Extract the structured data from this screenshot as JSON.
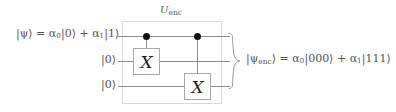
{
  "figure": {
    "type": "quantum-circuit",
    "background_color": "#ffffff",
    "wire_color": "#8d8d8d",
    "box_border_color": "#d9d9d9",
    "gate_border_color": "#a8a8a8",
    "control_dot_color": "#111111",
    "text_color": "#555555"
  },
  "labels": {
    "input_state": "|ψ⟩ = α",
    "input_sub_0": "0",
    "input_ket_0": "|0⟩ + α",
    "input_sub_1": "1",
    "input_ket_1": "|1⟩",
    "unitary_name": "U",
    "unitary_subscript": "enc",
    "output_state_open": "|ψ",
    "output_subscript": "enc",
    "output_state_eq": "⟩ = α",
    "output_sub_0": "0",
    "output_ket_000": "|000⟩ + α",
    "output_sub_1": "1",
    "output_ket_111": "|111⟩"
  },
  "qubits": [
    {
      "index": 0,
      "input_label": "|ψ⟩ = α₀|0⟩ + α₁|1⟩",
      "role": "data"
    },
    {
      "index": 1,
      "input_label": "|0⟩",
      "role": "ancilla"
    },
    {
      "index": 2,
      "input_label": "|0⟩",
      "role": "ancilla"
    }
  ],
  "ancillas": {
    "first": "|0⟩",
    "second": "|0⟩"
  },
  "gates": [
    {
      "name": "CNOT",
      "control_qubit": 0,
      "target_qubit": 1,
      "target_symbol": "X",
      "column": 1
    },
    {
      "name": "CNOT",
      "control_qubit": 0,
      "target_qubit": 2,
      "target_symbol": "X",
      "column": 2
    }
  ],
  "gate_symbols": {
    "first_x": "X",
    "second_x": "X"
  }
}
